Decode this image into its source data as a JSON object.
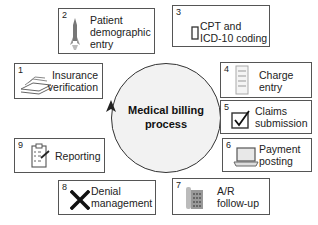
{
  "diagram": {
    "center": {
      "line1": "Medical billing",
      "line2": "process"
    },
    "steps": [
      {
        "num": "1",
        "line1": "Insurance",
        "line2": "verification",
        "icon": "book-stack-icon"
      },
      {
        "num": "2",
        "line1": "Patient",
        "line2": "demographic",
        "line3": "entry",
        "icon": "rocket-icon"
      },
      {
        "num": "3",
        "line1": "CPT and",
        "line2": "ICD-10 coding",
        "icon": "rectangle-icon"
      },
      {
        "num": "4",
        "line1": "Charge",
        "line2": "entry",
        "icon": "document-icon"
      },
      {
        "num": "5",
        "line1": "Claims",
        "line2": "submission",
        "icon": "checkbox-icon"
      },
      {
        "num": "6",
        "line1": "Payment",
        "line2": "posting",
        "icon": "laptop-icon"
      },
      {
        "num": "7",
        "line1": "A/R",
        "line2": "follow-up",
        "icon": "phone-icon"
      },
      {
        "num": "8",
        "line1": "Denial",
        "line2": "management",
        "icon": "x-mark-icon"
      },
      {
        "num": "9",
        "line1": "Reporting",
        "icon": "clipboard-icon"
      }
    ],
    "colors": {
      "border": "#555555",
      "circle_fill": "#f2f2f2",
      "text": "#222222"
    }
  }
}
